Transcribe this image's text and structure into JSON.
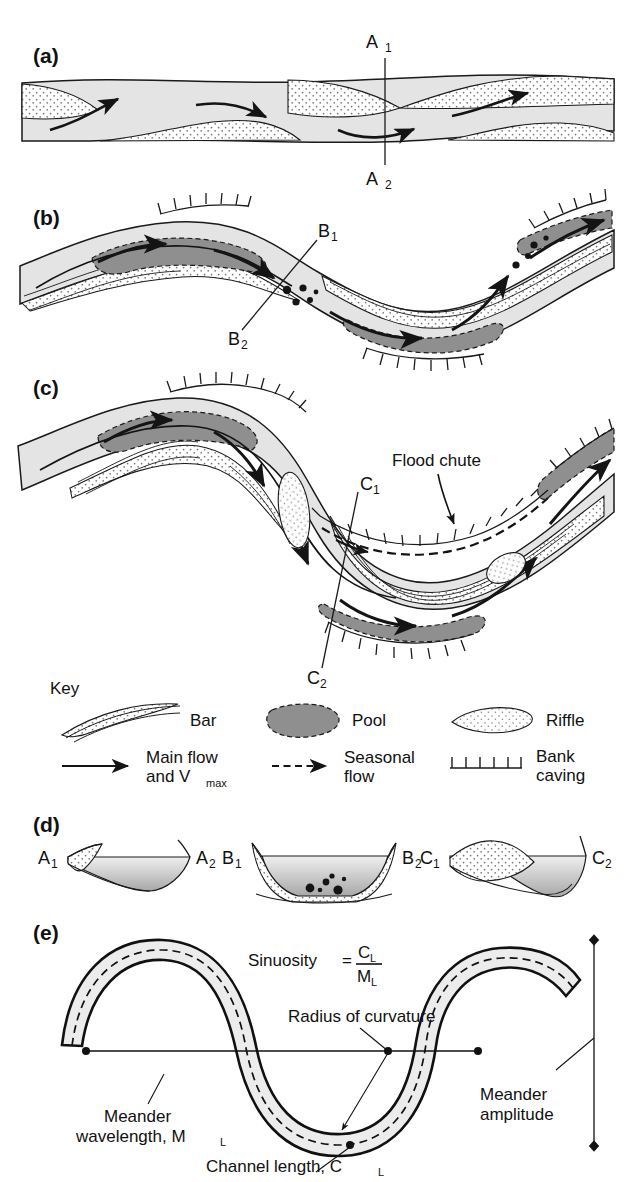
{
  "figure": {
    "type": "geomorphology-diagram"
  },
  "colors": {
    "channel_fill": "#e4e4e4",
    "pool_fill": "#8f8f8f",
    "bar_fill": "#ffffff",
    "riffle_fill": "#fdfdfd",
    "stipple": "#7d7d7d",
    "line": "#1a1a1a",
    "page_bg": "#ffffff"
  },
  "panels": [
    {
      "id": "a",
      "label": "(a)",
      "caption_labels": [
        "A₁",
        "A₂"
      ]
    },
    {
      "id": "b",
      "label": "(b)",
      "caption_labels": [
        "B₁",
        "B₂"
      ]
    },
    {
      "id": "c",
      "label": "(c)",
      "caption_labels": [
        "C₁",
        "C₂"
      ],
      "annotations": [
        "Flood chute"
      ]
    },
    {
      "id": "d",
      "label": "(d)",
      "sections": [
        {
          "left": "A₁",
          "right": "A₂",
          "shape": "shallow asymmetric"
        },
        {
          "left": "B₁",
          "right": "B₂",
          "shape": "symmetric riffle with gravel"
        },
        {
          "left": "C₁",
          "right": "C₂",
          "shape": "strongly asymmetric point bar and pool"
        }
      ]
    },
    {
      "id": "e",
      "label": "(e)",
      "annotations": [
        "Radius of curvature",
        "Meander wavelength, Mₗ",
        "Channel length, Cₗ",
        "Meander amplitude"
      ]
    }
  ],
  "section_markers": {
    "a1": "A",
    "a1_sub": "1",
    "a2": "A",
    "a2_sub": "2",
    "b1": "B",
    "b1_sub": "1",
    "b2": "B",
    "b2_sub": "2",
    "c1": "C",
    "c1_sub": "1",
    "c2": "C",
    "c2_sub": "2"
  },
  "panel_c": {
    "flood_chute": "Flood chute"
  },
  "key": {
    "title": "Key",
    "items": [
      {
        "symbol": "bar-crescent",
        "label": "Bar",
        "label2": ""
      },
      {
        "symbol": "pool-blob",
        "label": "Pool",
        "label2": ""
      },
      {
        "symbol": "riffle-ellipse",
        "label": "Riffle",
        "label2": ""
      },
      {
        "symbol": "solid-arrow",
        "label": "Main flow",
        "label2": "and V",
        "label2_sub": "max"
      },
      {
        "symbol": "dashed-arrow",
        "label": "Seasonal",
        "label2": "flow"
      },
      {
        "symbol": "tick-hachure",
        "label": "Bank",
        "label2": "caving"
      }
    ]
  },
  "panel_e": {
    "sinuosity_word": "Sinuosity",
    "equals": "=",
    "numerator": "C",
    "numerator_sub": "L",
    "denominator": "M",
    "denominator_sub": "L",
    "radius_label": "Radius of curvature",
    "wavelength_line1": "Meander",
    "wavelength_line2": "wavelength, M",
    "wavelength_sub": "L",
    "channel_length": "Channel length, C",
    "channel_length_sub": "L",
    "amplitude_line1": "Meander",
    "amplitude_line2": "amplitude"
  }
}
